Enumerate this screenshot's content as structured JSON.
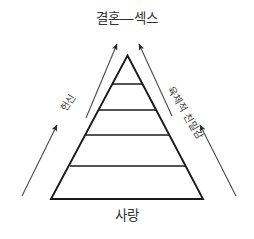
{
  "diagram": {
    "type": "pyramid",
    "title_top": "결혼—섹스",
    "title_bottom": "사랑",
    "left_axis_label": "헌신",
    "right_axis_label": "육체적 친밀감",
    "levels_count": 5,
    "stroke_color": "#1a1a1a",
    "arrow_color": "#555555",
    "background_color": "#ffffff",
    "text_color": "#333333"
  },
  "apex": {
    "label": "결혼—섹스"
  },
  "base": {
    "label": "사랑"
  },
  "sides": {
    "left": {
      "label": "헌신"
    },
    "right": {
      "label": "육체적 친밀감"
    }
  },
  "arrows": {
    "top_left": "arrow-up-right-icon",
    "top_right": "arrow-up-left-icon",
    "bottom_left": "arrow-up-right-icon",
    "bottom_right": "arrow-up-left-icon"
  }
}
